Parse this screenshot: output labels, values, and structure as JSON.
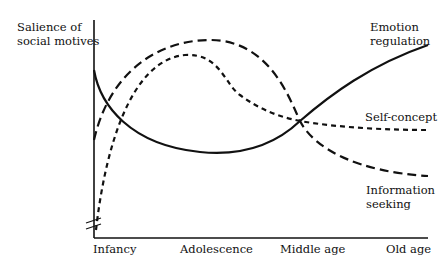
{
  "diagram": {
    "y_axis_label_line1": "Salience of",
    "y_axis_label_line2": "social motives",
    "x_axis_ticks": [
      "Infancy",
      "Adolescence",
      "Middle age",
      "Old age"
    ],
    "curves": [
      {
        "name": "Emotion regulation",
        "label_line1": "Emotion",
        "label_line2": "regulation",
        "style": "solid"
      },
      {
        "name": "Self-concept",
        "label_line1": "Self-concept",
        "style": "short-dash"
      },
      {
        "name": "Information seeking",
        "label_line1": "Information",
        "label_line2": "seeking",
        "style": "long-dash"
      }
    ],
    "colors": {
      "line": "#111111",
      "background": "#ffffff"
    }
  }
}
